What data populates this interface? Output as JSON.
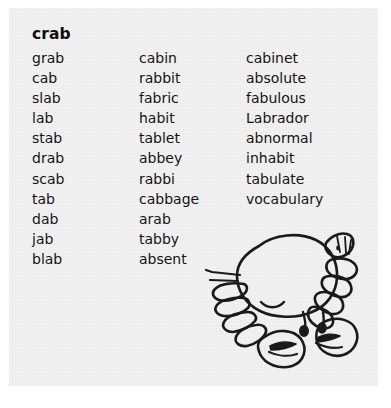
{
  "worksheet": {
    "headword": "crab",
    "columns": [
      {
        "name": "column-1",
        "words": [
          "grab",
          "cab",
          "slab",
          "lab",
          "stab",
          "drab",
          "scab",
          "tab",
          "dab",
          "jab",
          "blab"
        ]
      },
      {
        "name": "column-2",
        "words": [
          "cabin",
          "rabbit",
          "fabric",
          "habit",
          "tablet",
          "abbey",
          "rabbi",
          "cabbage",
          "arab",
          "tabby",
          "absent"
        ]
      },
      {
        "name": "column-3",
        "words": [
          "cabinet",
          "absolute",
          "fabulous",
          "Labrador",
          "abnormal",
          "inhabit",
          "tabulate",
          "vocabulary"
        ]
      }
    ],
    "illustration": {
      "name": "crab-illustration",
      "description": "crab"
    },
    "colors": {
      "page_background": "#ffffff",
      "panel_background": "#f1f1f1",
      "text": "#141414",
      "headword_text": "#0f0f0f",
      "line_art": "#1a1a1a"
    }
  }
}
